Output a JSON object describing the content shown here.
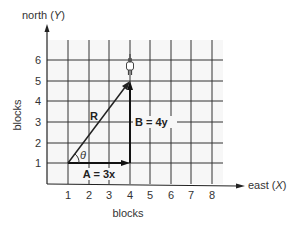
{
  "diagram": {
    "title_y_axis": "north (",
    "y_axis_var": "Y",
    "y_axis_close": ")",
    "title_x_axis": "east (",
    "x_axis_var": "X",
    "x_axis_close": ")",
    "x_label": "blocks",
    "y_label": "blocks",
    "x_ticks": [
      "1",
      "2",
      "3",
      "4",
      "5",
      "6",
      "7",
      "8"
    ],
    "y_ticks": [
      "1",
      "2",
      "3",
      "4",
      "5",
      "6"
    ],
    "vectors": {
      "R": {
        "label": "R",
        "from": [
          1,
          1
        ],
        "to": [
          4,
          5
        ]
      },
      "A": {
        "label": "A = 3x",
        "from": [
          1,
          1
        ],
        "to": [
          4,
          1
        ]
      },
      "B": {
        "label": "B = 4y",
        "from": [
          4,
          1
        ],
        "to": [
          4,
          5
        ]
      }
    },
    "angle_label": "θ",
    "person_position": [
      4,
      5.5
    ]
  }
}
